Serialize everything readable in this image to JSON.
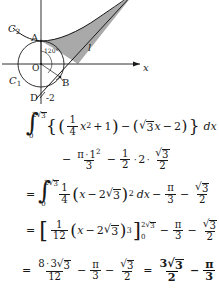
{
  "figure": {
    "labels": {
      "curve_c2": "C",
      "curve_c2_sub": "2",
      "curve_c1": "C",
      "curve_c1_sub": "1",
      "point_a": "A",
      "point_b": "B",
      "point_d": "D",
      "origin": "O",
      "y_intercept": "-2",
      "axis_x": "x",
      "line_l": "l",
      "angle": "120°"
    },
    "colors": {
      "stroke": "#1a1a1a",
      "shaded_region": "#a8a8a8",
      "background": "#ffffff"
    }
  },
  "math": {
    "line1": {
      "integral_lower": "0",
      "integral_upper": "2",
      "integral_upper_radicand": "3",
      "open_brace": "{",
      "open_paren": "(",
      "frac1_num": "1",
      "frac1_den": "4",
      "var_x": "x",
      "exp_2": "2",
      "plus": "+",
      "one": "1",
      "close_paren": ")",
      "minus": "−",
      "open_paren2": "(",
      "radicand3": "3",
      "var_x2": "x",
      "minus2": "−",
      "two": "2",
      "close_paren2": ")",
      "close_brace": "}",
      "dx": "dx"
    },
    "line2": {
      "minus": "−",
      "frac_num_pi": "π",
      "frac_num_dot": "·",
      "frac_num_one": "1",
      "frac_num_sup": "2",
      "frac_den": "3",
      "minus2": "−",
      "half_num": "1",
      "half_den": "2",
      "dot1": "·",
      "two": "2",
      "dot2": "·",
      "rad3_num": "3",
      "rad_den": "2"
    },
    "line3": {
      "equals": "=",
      "integral_lower": "0",
      "integral_upper": "2",
      "integral_upper_radicand": "3",
      "frac_num": "1",
      "frac_den": "4",
      "open_paren": "(",
      "var_x": "x",
      "minus": "−",
      "two": "2",
      "radicand3": "3",
      "close_paren": ")",
      "exp": "2",
      "dx": "dx",
      "minus2": "−",
      "pi": "π",
      "three": "3",
      "minus3": "−",
      "rad3": "3",
      "two_den": "2"
    },
    "line4": {
      "equals": "=",
      "lbracket": "[",
      "frac_num": "1",
      "frac_den": "12",
      "open_paren": "(",
      "var_x": "x",
      "minus": "−",
      "two": "2",
      "radicand3": "3",
      "close_paren": ")",
      "exp": "3",
      "rbracket": "]",
      "eval_upper": "2",
      "eval_upper_rad": "3",
      "eval_lower": "0",
      "minus2": "−",
      "pi": "π",
      "three": "3",
      "minus3": "−",
      "rad3": "3",
      "two_den": "2"
    },
    "line5": {
      "equals": "=",
      "frac1_num_eight": "8",
      "frac1_num_dot": "·",
      "frac1_num_three": "3",
      "frac1_num_rad": "3",
      "frac1_den": "12",
      "minus": "−",
      "pi": "π",
      "three": "3",
      "minus2": "−",
      "rad3": "3",
      "two_den": "2",
      "equals2": "=",
      "ans_num_three": "3",
      "ans_num_rad": "3",
      "ans_den": "2",
      "ans_minus": "−",
      "ans_pi": "π",
      "ans_three": "3"
    }
  }
}
